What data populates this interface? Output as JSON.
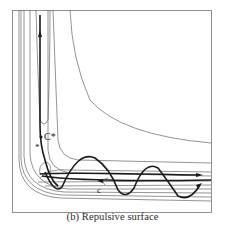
{
  "figure": {
    "caption": "(b) Repulsive surface",
    "labels": {
      "critical_point": "C*",
      "saddle_marker": "*",
      "lower_label": "c"
    },
    "colors": {
      "contour": "#6a6a6a",
      "trajectory": "#1a1a1a",
      "frame": "#777777",
      "background": "#ffffff"
    }
  }
}
